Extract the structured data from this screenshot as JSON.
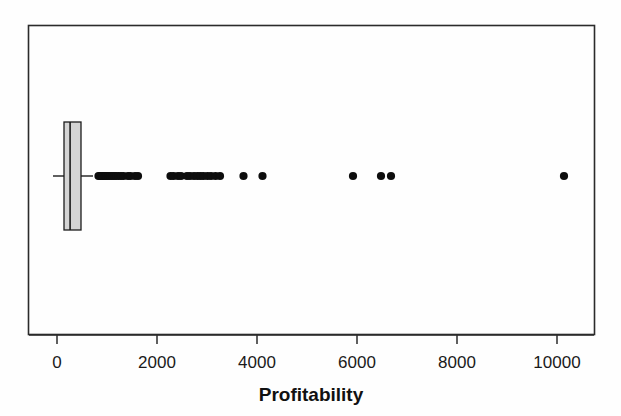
{
  "chart_data": {
    "type": "boxplot",
    "title": "",
    "xlabel": "Profitability",
    "ylabel": "",
    "orientation": "horizontal",
    "xlim": [
      -220,
      10750
    ],
    "xticks": [
      0,
      2000,
      4000,
      6000,
      8000,
      10000
    ],
    "xticklabels": [
      "0",
      "2000",
      "4000",
      "6000",
      "8000",
      "10000"
    ],
    "grid": false,
    "legend": false,
    "box_fill_color": "#d4d4d4",
    "box_line_color": "#1c1c1c",
    "outlier_color": "#0d0d0d",
    "series": [
      {
        "name": "Profitability",
        "whisker_low": -80,
        "q1": 140,
        "median": 262,
        "q3": 480,
        "whisker_high": 720,
        "outliers": [
          830,
          860,
          880,
          900,
          910,
          930,
          960,
          990,
          1020,
          1060,
          1100,
          1140,
          1180,
          1230,
          1280,
          1330,
          1420,
          1470,
          1560,
          1620,
          2270,
          2330,
          2420,
          2480,
          2600,
          2660,
          2740,
          2810,
          2870,
          2930,
          3010,
          3080,
          3170,
          3260,
          3730,
          4110,
          5920,
          6480,
          6680,
          10140
        ]
      }
    ]
  },
  "axis": {
    "label": "Profitability",
    "tick_0": "0",
    "tick_2000": "2000",
    "tick_4000": "4000",
    "tick_6000": "6000",
    "tick_8000": "8000",
    "tick_10000": "10000"
  }
}
